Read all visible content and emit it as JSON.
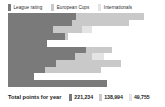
{
  "legend": {
    "items": [
      {
        "label": "League rating",
        "color": "#7a7a7a",
        "icon": "legend-swatch-icon"
      },
      {
        "label": "European Cups",
        "color": "#c9c9c9",
        "icon": "legend-swatch-icon"
      },
      {
        "label": "Internationals",
        "color": "#e4e4e4",
        "icon": "legend-swatch-icon"
      }
    ]
  },
  "footer": {
    "label": "Total points for year",
    "totals": [
      {
        "value": "221,234",
        "color": "#7a7a7a"
      },
      {
        "value": "138,994",
        "color": "#c9c9c9"
      },
      {
        "value": "49,755",
        "color": "#e4e4e4"
      }
    ]
  },
  "chart_data": {
    "type": "bar",
    "orientation": "horizontal",
    "stacked": true,
    "title": "",
    "subtitle": "",
    "xlabel": "",
    "ylabel": "",
    "grid": false,
    "legend_position": "top-left",
    "axis_visible": false,
    "tick_labels_visible": false,
    "xlim": [
      0,
      100
    ],
    "categories": [
      "1",
      "2",
      "3",
      "4",
      "5",
      "6",
      "7",
      "8",
      "9",
      "10",
      "11"
    ],
    "series": [
      {
        "name": "League rating",
        "color": "#7a7a7a",
        "values": [
          44,
          41,
          29,
          37,
          25,
          50,
          43,
          31,
          24,
          17,
          64
        ]
      },
      {
        "name": "European Cups",
        "color": "#c9c9c9",
        "values": [
          44,
          37,
          19,
          2,
          0,
          17,
          11,
          42,
          36,
          0,
          0
        ]
      },
      {
        "name": "Internationals",
        "color": "#e4e4e4",
        "values": [
          0,
          0,
          6,
          0,
          0,
          0,
          8,
          0,
          0,
          0,
          0
        ]
      }
    ],
    "totals": [
      221234,
      138994,
      49755
    ]
  }
}
